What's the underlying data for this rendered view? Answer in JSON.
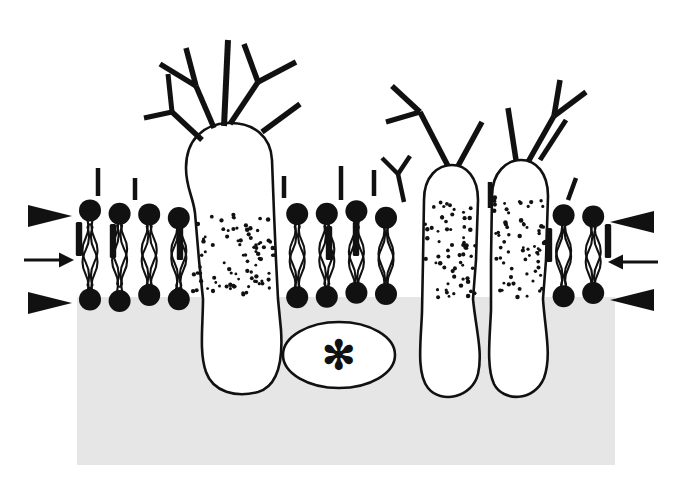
{
  "figure": {
    "title": "Fluid mosaic model of the plasma membrane",
    "domain": "biology-diagram",
    "canvas": {
      "width": 682,
      "height": 495,
      "background": "#ffffff"
    }
  },
  "colors": {
    "ink": "#111111",
    "lipid_head": "#111111",
    "cytoplasm_fill": "#e6e6e6",
    "protein_fill": "#ffffff",
    "stipple": "#111111",
    "outline": "#111111"
  },
  "geometry": {
    "cytoplasm_block": {
      "x": 77,
      "y": 297,
      "width": 538,
      "height": 168
    },
    "outer_leaflet_y": 214,
    "inner_leaflet_y": 297,
    "membrane_left": 77,
    "membrane_right": 615
  },
  "markers": {
    "left": [
      {
        "name": "arrowhead-upper-left",
        "type": "triangle",
        "direction": "right",
        "x": 28,
        "y": 216,
        "length": 44,
        "half_height": 11
      },
      {
        "name": "arrow-middle-left",
        "type": "line-arrow",
        "direction": "right",
        "x": 24,
        "y": 260,
        "length": 50
      },
      {
        "name": "arrowhead-lower-left",
        "type": "triangle",
        "direction": "right",
        "x": 28,
        "y": 303,
        "length": 44,
        "half_height": 11
      }
    ],
    "right": [
      {
        "name": "arrowhead-upper-right",
        "type": "triangle",
        "direction": "left",
        "x": 654,
        "y": 222,
        "length": 44,
        "half_height": 11
      },
      {
        "name": "arrow-middle-right",
        "type": "line-arrow",
        "direction": "left",
        "x": 658,
        "y": 262,
        "length": 50
      },
      {
        "name": "arrowhead-lower-right",
        "type": "triangle",
        "direction": "left",
        "x": 654,
        "y": 300,
        "length": 44,
        "half_height": 11
      }
    ]
  },
  "labels": {
    "peripheral_protein_marker": "✻"
  },
  "structures": {
    "integral_protein_large": {
      "name": "large-glycoprotein",
      "description": "Large integral glycoprotein spanning the bilayer with branched oligosaccharide chains on the extracellular face and a bulbous cytoplasmic domain",
      "stippled_band": {
        "x": 191,
        "y": 213,
        "width": 84,
        "height": 86
      }
    },
    "integral_protein_middle_right": {
      "name": "integral-protein-right-a",
      "description": "Narrow transmembrane glycoprotein with rounded extracellular cap",
      "stippled_band": {
        "x": 423,
        "y": 200,
        "width": 50,
        "height": 99
      }
    },
    "integral_protein_far_right": {
      "name": "integral-protein-right-b",
      "description": "Narrow transmembrane glycoprotein adjacent to the first, stippled membrane-spanning region",
      "stippled_band": {
        "x": 492,
        "y": 196,
        "width": 52,
        "height": 103
      }
    },
    "peripheral_protein": {
      "name": "peripheral-protein",
      "description": "Peripheral protein attached to the cytoplasmic face, marked with an asterisk",
      "x": 283,
      "y": 322,
      "width": 112,
      "height": 66
    }
  },
  "lipids": {
    "outer_heads": [
      {
        "x": 94,
        "y": 212
      },
      {
        "x": 131,
        "y": 219
      },
      {
        "x": 161,
        "y": 216
      },
      {
        "x": 281,
        "y": 215
      },
      {
        "x": 312,
        "y": 221
      },
      {
        "x": 341,
        "y": 216
      },
      {
        "x": 371,
        "y": 213
      },
      {
        "x": 401,
        "y": 220
      },
      {
        "x": 562,
        "y": 218
      },
      {
        "x": 591,
        "y": 213
      }
    ],
    "inner_heads": [
      {
        "x": 96,
        "y": 300
      },
      {
        "x": 127,
        "y": 305
      },
      {
        "x": 158,
        "y": 301
      },
      {
        "x": 281,
        "y": 303
      },
      {
        "x": 311,
        "y": 299
      },
      {
        "x": 341,
        "y": 304
      },
      {
        "x": 371,
        "y": 300
      },
      {
        "x": 401,
        "y": 304
      },
      {
        "x": 560,
        "y": 301
      },
      {
        "x": 590,
        "y": 305
      }
    ],
    "cholesterol_rods": [
      {
        "x": 79,
        "y": 222
      },
      {
        "x": 113,
        "y": 224
      },
      {
        "x": 180,
        "y": 226
      },
      {
        "x": 329,
        "y": 226
      },
      {
        "x": 356,
        "y": 222
      },
      {
        "x": 549,
        "y": 228
      },
      {
        "x": 608,
        "y": 224
      }
    ],
    "head_radius": 11,
    "tail_length": 70
  },
  "annotations": {
    "extracellular_side": "outside of cell (above membrane)",
    "cytoplasmic_side": "inside of cell (shaded region below membrane)"
  }
}
